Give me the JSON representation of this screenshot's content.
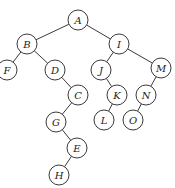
{
  "diagram": {
    "type": "binary-tree",
    "nodes": [
      {
        "id": "A",
        "label": "A",
        "x": 78,
        "y": 20
      },
      {
        "id": "B",
        "label": "B",
        "x": 27,
        "y": 44
      },
      {
        "id": "I",
        "label": "I",
        "x": 119,
        "y": 44
      },
      {
        "id": "F",
        "label": "F",
        "x": 7,
        "y": 70
      },
      {
        "id": "D",
        "label": "D",
        "x": 55,
        "y": 70
      },
      {
        "id": "J",
        "label": "J",
        "x": 101,
        "y": 70
      },
      {
        "id": "M",
        "label": "M",
        "x": 161,
        "y": 68
      },
      {
        "id": "C",
        "label": "C",
        "x": 78,
        "y": 95
      },
      {
        "id": "K",
        "label": "K",
        "x": 117,
        "y": 95
      },
      {
        "id": "N",
        "label": "N",
        "x": 146,
        "y": 95
      },
      {
        "id": "G",
        "label": "G",
        "x": 56,
        "y": 122
      },
      {
        "id": "L",
        "label": "L",
        "x": 104,
        "y": 120
      },
      {
        "id": "O",
        "label": "O",
        "x": 133,
        "y": 120
      },
      {
        "id": "E",
        "label": "E",
        "x": 77,
        "y": 148
      },
      {
        "id": "H",
        "label": "H",
        "x": 59,
        "y": 175
      }
    ],
    "edges": [
      [
        "A",
        "B"
      ],
      [
        "A",
        "I"
      ],
      [
        "B",
        "F"
      ],
      [
        "B",
        "D"
      ],
      [
        "D",
        "C"
      ],
      [
        "C",
        "G"
      ],
      [
        "G",
        "E"
      ],
      [
        "E",
        "H"
      ],
      [
        "I",
        "J"
      ],
      [
        "I",
        "M"
      ],
      [
        "J",
        "K"
      ],
      [
        "K",
        "L"
      ],
      [
        "M",
        "N"
      ],
      [
        "N",
        "O"
      ]
    ],
    "node_radius": 10
  }
}
